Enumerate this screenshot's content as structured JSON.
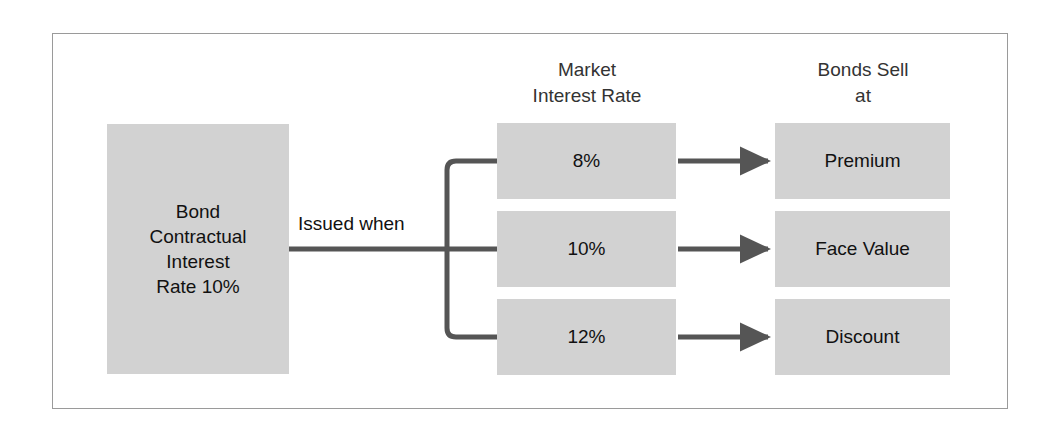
{
  "diagram": {
    "colors": {
      "box_fill": "#d2d2d2",
      "frame_border": "#9a9a9a",
      "connector": "#555555",
      "text": "#111111"
    },
    "source_box": {
      "label": "Bond\nContractual\nInterest\nRate 10%",
      "lines": [
        "Bond",
        "Contractual",
        "Interest",
        "Rate 10%"
      ]
    },
    "connector_label": "Issued when",
    "columns": [
      {
        "header_lines": [
          "Market",
          "Interest Rate"
        ],
        "header": "Market Interest Rate"
      },
      {
        "header_lines": [
          "Bonds Sell",
          "at"
        ],
        "header": "Bonds Sell at"
      }
    ],
    "rows": [
      {
        "market_rate": "8%",
        "bonds_sell_at": "Premium"
      },
      {
        "market_rate": "10%",
        "bonds_sell_at": "Face Value"
      },
      {
        "market_rate": "12%",
        "bonds_sell_at": "Discount"
      }
    ],
    "arrows": {
      "branch_icon": "branch-connector-icon",
      "arrow_icon": "arrow-right-icon"
    }
  }
}
